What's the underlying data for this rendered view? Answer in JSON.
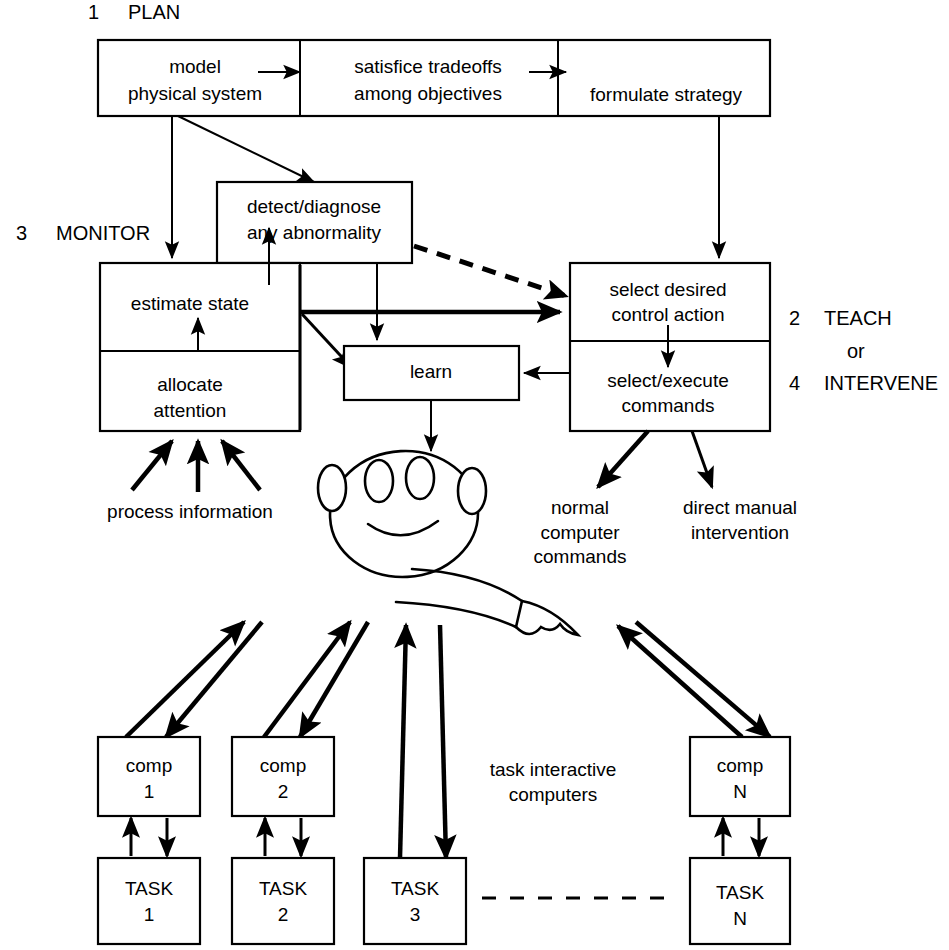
{
  "diagram": {
    "title_labels": [
      {
        "num": "1",
        "text": "PLAN"
      },
      {
        "num": "3",
        "text": "MONITOR"
      },
      {
        "num": "2",
        "text": "TEACH"
      },
      {
        "num": "",
        "text": "or"
      },
      {
        "num": "4",
        "text": "INTERVENE"
      }
    ],
    "plan_row": {
      "cell1_line1": "model",
      "cell1_line2": "physical system",
      "cell2_line1": "satisfice tradeoffs",
      "cell2_line2": "among objectives",
      "cell3_line1": "formulate strategy"
    },
    "detect_box": {
      "line1": "detect/diagnose",
      "line2": "any abnormality"
    },
    "monitor_box": {
      "upper": "estimate state",
      "lower_line1": "allocate",
      "lower_line2": "attention"
    },
    "learn_box": {
      "label": "learn"
    },
    "teach_box": {
      "upper_line1": "select desired",
      "upper_line2": "control action",
      "lower_line1": "select/execute",
      "lower_line2": "commands"
    },
    "annotations": {
      "process_information": "process information",
      "normal_commands_line1": "normal",
      "normal_commands_line2": "computer",
      "normal_commands_line3": "commands",
      "direct_manual_line1": "direct manual",
      "direct_manual_line2": "intervention",
      "task_interactive_line1": "task interactive",
      "task_interactive_line2": "computers"
    },
    "computers": [
      {
        "name_line1": "comp",
        "name_line2": "1"
      },
      {
        "name_line1": "comp",
        "name_line2": "2"
      },
      {
        "name_line1": "comp",
        "name_line2": "N"
      }
    ],
    "tasks": [
      {
        "name_line1": "TASK",
        "name_line2": "1"
      },
      {
        "name_line1": "TASK",
        "name_line2": "2"
      },
      {
        "name_line1": "TASK",
        "name_line2": "3"
      },
      {
        "name_line1": "TASK",
        "name_line2": "N"
      }
    ],
    "colors": {
      "stroke": "#000000",
      "fill": "#ffffff"
    }
  }
}
